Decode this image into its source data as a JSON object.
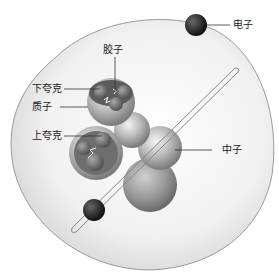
{
  "diagram": {
    "labels": {
      "electron": "电子",
      "gluon": "胶子",
      "down_quark": "下夸克",
      "proton": "质子",
      "up_quark": "上夸克",
      "neutron": "中子"
    }
  }
}
